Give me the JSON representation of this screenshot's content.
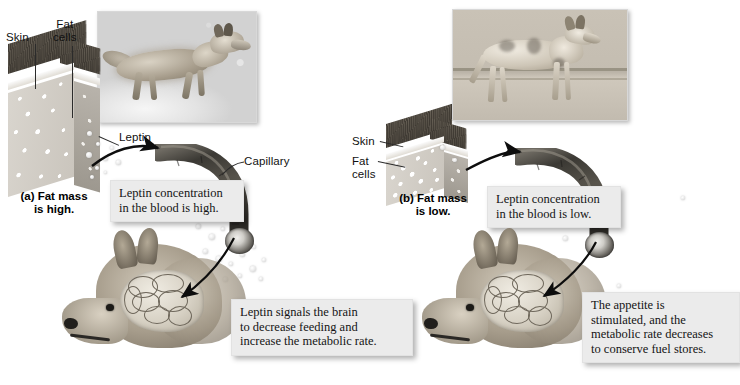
{
  "figure": {
    "type": "two-panel biology diagram"
  },
  "panel_a": {
    "caption": "(a) Fat mass\nis high.",
    "labels": {
      "skin": "Skin",
      "fat_cells": "Fat\ncells",
      "leptin": "Leptin",
      "capillary": "Capillary"
    },
    "callout_blood": "Leptin concentration\nin the blood is high.",
    "callout_brain": "Leptin signals the brain\nto decrease feeding and\nincrease the metabolic rate.",
    "photo_alt": "well-fed coyote walking in snow",
    "leptin_density": "high"
  },
  "panel_b": {
    "caption": "(b) Fat mass\nis low.",
    "labels": {
      "skin": "Skin",
      "fat_cells": "Fat\ncells"
    },
    "callout_blood": "Leptin concentration\nin the blood is low.",
    "callout_brain": "The appetite is\nstimulated, and the\nmetabolic rate decreases\nto conserve fuel stores.",
    "photo_alt": "emaciated coyote standing",
    "leptin_density": "low"
  },
  "colors": {
    "callout_bg": "#ebebeb",
    "text": "#141414",
    "arrow": "#101010",
    "fat_face": "#d4cfc8",
    "fur_dark": "#46413a",
    "capillary_dark": "#3a3833"
  }
}
